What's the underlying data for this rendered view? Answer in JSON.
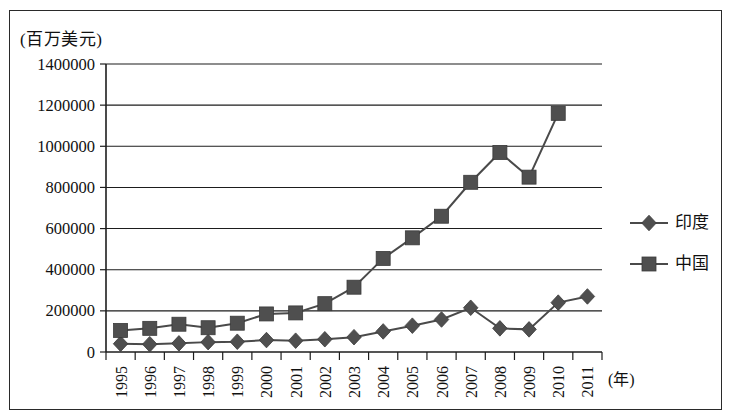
{
  "chart_data": {
    "type": "line",
    "title": "",
    "subtitle": "",
    "xlabel": "(年)",
    "ylabel": "(百万美元)",
    "x": [
      1995,
      1996,
      1997,
      1998,
      1999,
      2000,
      2001,
      2002,
      2003,
      2004,
      2005,
      2006,
      2007,
      2008,
      2009,
      2010,
      2011
    ],
    "categories": [
      "1995",
      "1996",
      "1997",
      "1998",
      "1999",
      "2000",
      "2001",
      "2002",
      "2003",
      "2004",
      "2005",
      "2006",
      "2007",
      "2008",
      "2009",
      "2010",
      "2011"
    ],
    "series": [
      {
        "name": "印度",
        "marker": "diamond",
        "color": "#4f4f4f",
        "values": [
          40000,
          38000,
          42000,
          48000,
          50000,
          58000,
          55000,
          62000,
          72000,
          100000,
          128000,
          158000,
          215000,
          115000,
          110000,
          240000,
          270000
        ]
      },
      {
        "name": "中国",
        "marker": "square",
        "color": "#4f4f4f",
        "values": [
          105000,
          115000,
          135000,
          118000,
          140000,
          185000,
          190000,
          235000,
          315000,
          455000,
          555000,
          660000,
          825000,
          970000,
          850000,
          1160000,
          null
        ]
      }
    ],
    "ylim": [
      0,
      1400000
    ],
    "yticks": [
      0,
      200000,
      400000,
      600000,
      800000,
      1000000,
      1200000,
      1400000
    ],
    "ytick_labels": [
      "0",
      "200000",
      "400000",
      "600000",
      "800000",
      "1000000",
      "1200000",
      "1400000"
    ],
    "grid": true,
    "grid_axis": "y",
    "legend_position": "right",
    "legend_entries": [
      "印度",
      "中国"
    ]
  },
  "legend": {
    "india_label": "印度",
    "china_label": "中国"
  },
  "axes": {
    "y_unit": "(百万美元)",
    "x_unit": "(年)"
  }
}
